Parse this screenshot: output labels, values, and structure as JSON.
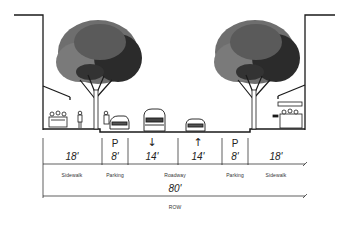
{
  "diagram": {
    "type": "street-cross-section",
    "segments": [
      {
        "name": "sidewalk-left",
        "width": "18'",
        "label": "Sidewalk",
        "symbol": ""
      },
      {
        "name": "parking-left",
        "width": "8'",
        "label": "Parking",
        "symbol": "P"
      },
      {
        "name": "lane-left",
        "width": "14'",
        "label": "",
        "symbol": "↓"
      },
      {
        "name": "lane-right",
        "width": "14'",
        "label": "",
        "symbol": "↑"
      },
      {
        "name": "parking-right",
        "width": "8'",
        "label": "Parking",
        "symbol": "P"
      },
      {
        "name": "sidewalk-right",
        "width": "18'",
        "label": "Sidewalk",
        "symbol": ""
      }
    ],
    "roadway_label": "Roadway",
    "total": {
      "width": "80'",
      "label": "ROW"
    },
    "colors": {
      "ink": "#1a1a1a",
      "tree_canopy_light": "#6e6e6e",
      "tree_canopy_dark": "#2b2b2b",
      "background": "#ffffff"
    }
  }
}
